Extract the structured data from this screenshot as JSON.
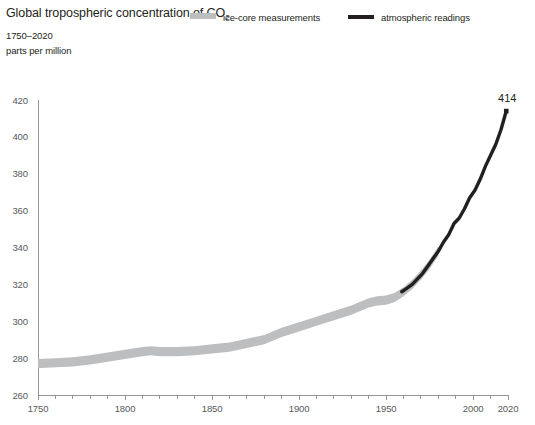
{
  "header": {
    "clipped_subscript": "2",
    "title_main": "Global tropospheric concentration of CO",
    "title_subscript": "2",
    "subtitle": "1750–2020",
    "units": "parts per million"
  },
  "legend": {
    "items": [
      {
        "label": "ice-core measurements",
        "color": "#bcbec0",
        "marker": "band"
      },
      {
        "label": "atmospheric readings",
        "color": "#231f20",
        "marker": "line"
      }
    ]
  },
  "chart_data": {
    "type": "line",
    "title": "Global tropospheric concentration of CO2",
    "subtitle": "1750–2020",
    "xlabel": "",
    "ylabel": "parts per million",
    "xlim": [
      1750,
      2020
    ],
    "ylim": [
      260,
      420
    ],
    "grid": false,
    "legend_position": "top-right",
    "x_ticks_major": [
      1750,
      1800,
      1850,
      1900,
      1950,
      2000,
      2020
    ],
    "x_ticks_minor_step": 10,
    "y_ticks": [
      260,
      280,
      300,
      320,
      340,
      360,
      380,
      400,
      420
    ],
    "annotations": [
      {
        "text": "414",
        "x": 2019,
        "y": 414,
        "marker": "square"
      }
    ],
    "series": [
      {
        "name": "ice-core measurements",
        "color": "#bcbec0",
        "style": "band",
        "band_width_ppm": 5,
        "x": [
          1750,
          1760,
          1770,
          1780,
          1790,
          1800,
          1810,
          1815,
          1820,
          1830,
          1840,
          1850,
          1860,
          1870,
          1880,
          1890,
          1900,
          1910,
          1920,
          1930,
          1940,
          1945,
          1950,
          1955,
          1960,
          1965,
          1970,
          1975,
          1980
        ],
        "values": [
          277,
          277.5,
          278,
          279,
          280.5,
          282,
          283.5,
          284,
          283.5,
          283.5,
          284,
          285,
          286,
          288,
          290,
          294,
          297,
          300,
          303,
          306,
          310,
          311,
          311.5,
          313,
          316,
          320,
          325,
          331,
          338
        ]
      },
      {
        "name": "atmospheric readings",
        "color": "#231f20",
        "style": "line",
        "x": [
          1959,
          1962,
          1965,
          1968,
          1971,
          1974,
          1977,
          1980,
          1983,
          1986,
          1989,
          1992,
          1995,
          1998,
          2001,
          2004,
          2007,
          2010,
          2013,
          2016,
          2019
        ],
        "values": [
          316,
          318,
          320,
          323,
          326,
          330,
          334,
          338,
          343,
          347,
          353,
          356,
          361,
          367,
          371,
          377,
          384,
          390,
          396,
          404,
          414
        ]
      }
    ]
  }
}
